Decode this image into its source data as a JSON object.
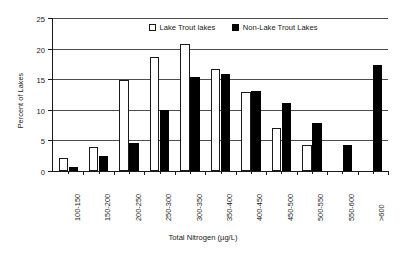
{
  "chart_data": {
    "type": "bar",
    "title": "",
    "xlabel": "Total Nitrogen (µg/L)",
    "ylabel": "Percent of Lakes",
    "ylim": [
      0,
      25
    ],
    "yticks": [
      0,
      5,
      10,
      15,
      20,
      25
    ],
    "grid": true,
    "legend_position": "top-center",
    "categories": [
      "100-150",
      "150-200",
      "200-250",
      "250-300",
      "300-350",
      "350-400",
      "400-450",
      "450-500",
      "500-550",
      "550-600",
      ">600"
    ],
    "series": [
      {
        "name": "Lake Trout lakes",
        "color": "#ffffff",
        "edge_color": "#1a1a1a",
        "values": [
          2.1,
          4.0,
          14.8,
          18.7,
          20.8,
          16.6,
          12.9,
          7.1,
          4.2,
          0,
          0
        ]
      },
      {
        "name": "Non-Lake Trout Lakes",
        "color": "#000000",
        "edge_color": "#000000",
        "values": [
          0.6,
          2.4,
          4.5,
          9.9,
          15.3,
          15.8,
          13.0,
          11.1,
          7.9,
          4.2,
          17.3
        ]
      }
    ]
  },
  "legend": {
    "entries": [
      {
        "label": "Lake Trout lakes",
        "style": "open"
      },
      {
        "label": "Non-Lake Trout Lakes",
        "style": "filled"
      }
    ]
  }
}
